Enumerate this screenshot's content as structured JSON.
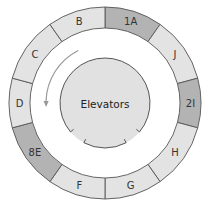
{
  "diagram": {
    "center_label": "Elevators",
    "colors": {
      "dark_segment": "#b3b3b3",
      "light_segment": "#e3e3e3",
      "core": "#e1e1e1",
      "stroke": "#555555",
      "arrow": "#999999"
    },
    "segments": [
      {
        "label": "1A",
        "start": 0,
        "end": 35,
        "shade": "dark"
      },
      {
        "label": "J",
        "start": 35,
        "end": 75,
        "shade": "light"
      },
      {
        "label": "2I",
        "start": 75,
        "end": 105,
        "shade": "dark"
      },
      {
        "label": "H",
        "start": 105,
        "end": 145,
        "shade": "light"
      },
      {
        "label": "G",
        "start": 145,
        "end": 180,
        "shade": "light"
      },
      {
        "label": "F",
        "start": 180,
        "end": 215,
        "shade": "light"
      },
      {
        "label": "8E",
        "start": 215,
        "end": 255,
        "shade": "dark"
      },
      {
        "label": "D",
        "start": 255,
        "end": 285,
        "shade": "light"
      },
      {
        "label": "C",
        "start": 285,
        "end": 325,
        "shade": "light"
      },
      {
        "label": "B",
        "start": 325,
        "end": 360,
        "shade": "light"
      }
    ],
    "corridor_arrow": {
      "direction": "counterclockwise",
      "icon": "curved-arrow-icon"
    }
  }
}
